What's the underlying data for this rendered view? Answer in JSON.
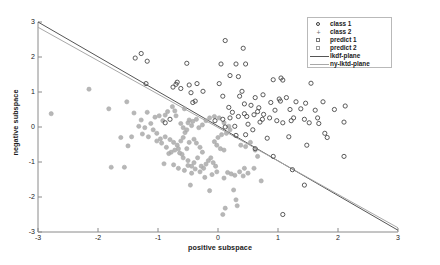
{
  "chart_data": {
    "type": "scatter",
    "title": "",
    "xlabel": "positive subspace",
    "ylabel": "negative subspace",
    "xlim": [
      -3,
      3
    ],
    "ylim": [
      -3,
      3
    ],
    "xticks": [
      "-3",
      "-2",
      "-1",
      "0",
      "1",
      "2",
      "3"
    ],
    "yticks": [
      "-3",
      "-2",
      "-1",
      "0",
      "1",
      "2",
      "3"
    ],
    "grid": false,
    "legend_position": "top-right",
    "legend": [
      {
        "label": "class 1",
        "marker": "circle-open-icon",
        "color": "#3a3a3a"
      },
      {
        "label": "class 2",
        "marker": "plus-icon",
        "color": "#6e6e6e"
      },
      {
        "label": "predict 1",
        "marker": "square-open-icon",
        "color": "#777777"
      },
      {
        "label": "predict 2",
        "marker": "square-open-icon",
        "color": "#999999"
      },
      {
        "label": "lkdf-plane",
        "marker": "solid-line-icon",
        "color": "#555555"
      },
      {
        "label": "ny-lktd-plane",
        "marker": "solid-line-icon",
        "color": "#a8a8a8"
      }
    ],
    "lines": [
      {
        "name": "lkdf-plane",
        "color": "#555555",
        "x": [
          -3,
          3
        ],
        "y": [
          3.0,
          -2.95
        ]
      },
      {
        "name": "ny-lktd-plane",
        "color": "#a8a8a8",
        "x": [
          -3,
          3
        ],
        "y": [
          2.85,
          -2.88
        ]
      }
    ],
    "series": [
      {
        "name": "class 1",
        "marker": "circle-open",
        "color": "#4a4a4a",
        "points": [
          [
            0.12,
            2.47
          ],
          [
            0.42,
            2.25
          ],
          [
            -1.28,
            2.1
          ],
          [
            -1.38,
            1.97
          ],
          [
            -1.18,
            1.88
          ],
          [
            0.05,
            1.8
          ],
          [
            -0.52,
            1.82
          ],
          [
            0.3,
            1.8
          ],
          [
            0.46,
            1.8
          ],
          [
            0.2,
            1.47
          ],
          [
            1.05,
            1.4
          ],
          [
            1.08,
            1.34
          ],
          [
            0.92,
            1.35
          ],
          [
            0.34,
            1.44
          ],
          [
            1.55,
            1.25
          ],
          [
            -0.7,
            1.22
          ],
          [
            -0.68,
            1.28
          ],
          [
            -0.48,
            1.2
          ],
          [
            -0.35,
            1.24
          ],
          [
            0.02,
            1.24
          ],
          [
            -0.75,
            1.14
          ],
          [
            -0.62,
            1.1
          ],
          [
            -0.25,
            1.02
          ],
          [
            -0.45,
            0.98
          ],
          [
            0.4,
            1.02
          ],
          [
            0.36,
            0.88
          ],
          [
            0.08,
            0.88
          ],
          [
            0.62,
            0.84
          ],
          [
            0.75,
            0.92
          ],
          [
            1.02,
            0.8
          ],
          [
            1.04,
            0.74
          ],
          [
            0.88,
            0.7
          ],
          [
            1.3,
            0.72
          ],
          [
            1.46,
            0.68
          ],
          [
            1.75,
            0.72
          ],
          [
            -0.38,
            0.74
          ],
          [
            -0.42,
            0.7
          ],
          [
            0.44,
            0.66
          ],
          [
            0.55,
            0.62
          ],
          [
            0.68,
            0.55
          ],
          [
            0.18,
            0.56
          ],
          [
            0.95,
            0.48
          ],
          [
            1.2,
            0.5
          ],
          [
            1.38,
            0.52
          ],
          [
            1.62,
            0.48
          ],
          [
            2.12,
            0.6
          ],
          [
            1.94,
            0.5
          ],
          [
            1.66,
            0.26
          ],
          [
            1.44,
            0.22
          ],
          [
            1.22,
            0.18
          ],
          [
            0.86,
            0.26
          ],
          [
            0.74,
            0.22
          ],
          [
            0.6,
            0.35
          ],
          [
            0.44,
            0.38
          ],
          [
            0.34,
            0.3
          ],
          [
            0.2,
            0.26
          ],
          [
            0.08,
            0.22
          ],
          [
            -0.05,
            0.18
          ],
          [
            0.5,
            0.08
          ],
          [
            0.7,
            0.14
          ],
          [
            1.08,
            0.12
          ],
          [
            1.52,
            0.12
          ],
          [
            2.1,
            0.14
          ],
          [
            1.68,
            0.1
          ],
          [
            0.28,
            0.02
          ],
          [
            0.12,
            0.0
          ],
          [
            0.58,
            -0.08
          ],
          [
            0.46,
            -0.22
          ],
          [
            0.3,
            -0.24
          ],
          [
            0.82,
            -0.32
          ],
          [
            1.18,
            -0.28
          ],
          [
            1.78,
            -0.18
          ],
          [
            1.82,
            -0.3
          ],
          [
            1.48,
            -0.52
          ],
          [
            0.62,
            -0.62
          ],
          [
            0.92,
            -0.84
          ],
          [
            2.1,
            -0.84
          ],
          [
            1.24,
            -1.22
          ],
          [
            1.44,
            -1.66
          ],
          [
            1.08,
            -2.5
          ],
          [
            -0.88,
            0.12
          ],
          [
            -0.8,
            0.22
          ],
          [
            -1.2,
            1.24
          ],
          [
            0.24,
            0.42
          ],
          [
            0.48,
            0.3
          ],
          [
            0.66,
            0.44
          ],
          [
            0.76,
            0.36
          ],
          [
            1.14,
            0.84
          ],
          [
            1.26,
            0.26
          ],
          [
            0.98,
            0.18
          ]
        ]
      },
      {
        "name": "class 2",
        "marker": "circle-filled",
        "color": "#aaaaaa",
        "points": [
          [
            -2.78,
            0.38
          ],
          [
            -2.15,
            1.08
          ],
          [
            -1.82,
            0.52
          ],
          [
            -1.52,
            0.72
          ],
          [
            -1.62,
            -0.3
          ],
          [
            -1.44,
            -0.28
          ],
          [
            -1.5,
            -0.54
          ],
          [
            -1.78,
            -1.15
          ],
          [
            -1.56,
            -1.15
          ],
          [
            -1.4,
            0.4
          ],
          [
            -1.28,
            0.2
          ],
          [
            -1.18,
            0.42
          ],
          [
            -1.05,
            0.28
          ],
          [
            -0.98,
            0.32
          ],
          [
            -1.12,
            0.1
          ],
          [
            -1.22,
            -0.02
          ],
          [
            -1.08,
            -0.08
          ],
          [
            -1.02,
            -0.18
          ],
          [
            -0.96,
            -0.34
          ],
          [
            -1.02,
            -0.4
          ],
          [
            -0.94,
            -0.46
          ],
          [
            -0.88,
            -0.28
          ],
          [
            -0.8,
            -0.36
          ],
          [
            -0.74,
            -0.44
          ],
          [
            -0.86,
            -0.58
          ],
          [
            -0.78,
            -0.72
          ],
          [
            -0.82,
            -0.76
          ],
          [
            -0.68,
            -0.52
          ],
          [
            -0.62,
            -0.4
          ],
          [
            -0.58,
            -0.3
          ],
          [
            -0.9,
            -1.05
          ],
          [
            -0.74,
            -1.08
          ],
          [
            -0.6,
            -0.78
          ],
          [
            -0.52,
            -0.62
          ],
          [
            -0.48,
            -0.44
          ],
          [
            -0.55,
            -0.16
          ],
          [
            -0.52,
            -0.08
          ],
          [
            -0.58,
            -0.02
          ],
          [
            -0.62,
            0.1
          ],
          [
            -0.7,
            0.32
          ],
          [
            -0.76,
            0.58
          ],
          [
            -0.88,
            0.34
          ],
          [
            -0.4,
            -0.35
          ],
          [
            -0.36,
            -0.46
          ],
          [
            -0.3,
            -0.58
          ],
          [
            -0.26,
            -0.72
          ],
          [
            -0.34,
            -0.88
          ],
          [
            -0.4,
            -1.02
          ],
          [
            -0.44,
            -1.12
          ],
          [
            -0.38,
            -1.2
          ],
          [
            -0.3,
            -1.28
          ],
          [
            -0.24,
            -1.18
          ],
          [
            -0.2,
            -1.06
          ],
          [
            -0.16,
            -0.96
          ],
          [
            -0.12,
            -0.88
          ],
          [
            -0.08,
            -1.02
          ],
          [
            -0.04,
            -1.12
          ],
          [
            -0.02,
            -1.28
          ],
          [
            -0.1,
            -1.36
          ],
          [
            -0.22,
            -1.44
          ],
          [
            -0.46,
            -1.66
          ],
          [
            -0.14,
            -1.82
          ],
          [
            0.08,
            -2.5
          ],
          [
            0.12,
            -2.32
          ],
          [
            0.3,
            -2.08
          ],
          [
            0.32,
            -2.25
          ],
          [
            0.26,
            -1.8
          ],
          [
            0.1,
            -1.46
          ],
          [
            0.16,
            -1.3
          ],
          [
            0.22,
            -1.34
          ],
          [
            0.28,
            -1.38
          ],
          [
            0.36,
            -1.28
          ],
          [
            0.44,
            -1.18
          ],
          [
            0.6,
            -1.18
          ],
          [
            0.72,
            -1.54
          ],
          [
            0.04,
            -0.62
          ],
          [
            0.1,
            -0.66
          ],
          [
            -0.02,
            -0.52
          ],
          [
            -0.06,
            -0.42
          ],
          [
            0.0,
            -0.3
          ],
          [
            0.06,
            -0.22
          ],
          [
            0.14,
            -0.18
          ],
          [
            0.2,
            -0.08
          ],
          [
            0.18,
            0.02
          ],
          [
            0.1,
            0.12
          ],
          [
            0.02,
            0.26
          ],
          [
            -0.06,
            0.3
          ],
          [
            -0.14,
            0.26
          ],
          [
            -0.2,
            0.18
          ],
          [
            -0.26,
            0.06
          ],
          [
            -0.32,
            -0.02
          ],
          [
            -0.44,
            0.04
          ],
          [
            -0.5,
            0.12
          ],
          [
            -0.66,
            -0.62
          ],
          [
            -0.72,
            -0.66
          ],
          [
            -0.64,
            -0.74
          ],
          [
            -0.58,
            -0.88
          ],
          [
            -0.5,
            -0.96
          ],
          [
            -0.44,
            -1.32
          ],
          [
            -0.28,
            -1.12
          ],
          [
            0.38,
            -0.52
          ],
          [
            0.46,
            -0.56
          ],
          [
            0.54,
            -0.44
          ],
          [
            0.62,
            -0.66
          ],
          [
            0.66,
            -0.84
          ],
          [
            -1.32,
            0.02
          ],
          [
            -1.26,
            -0.2
          ],
          [
            -1.16,
            -0.28
          ],
          [
            -0.92,
            0.18
          ],
          [
            -0.84,
            0.44
          ],
          [
            -0.72,
            0.46
          ],
          [
            -0.56,
            0.52
          ],
          [
            -0.48,
            0.2
          ],
          [
            -0.42,
            0.16
          ],
          [
            -0.36,
            0.22
          ],
          [
            -0.66,
            -1.18
          ],
          [
            -0.56,
            -1.24
          ],
          [
            -0.5,
            -1.1
          ],
          [
            0.42,
            -1.4
          ],
          [
            0.5,
            -1.32
          ]
        ]
      }
    ]
  },
  "axes": {
    "xlabel": "positive subspace",
    "ylabel": "negative subspace"
  }
}
